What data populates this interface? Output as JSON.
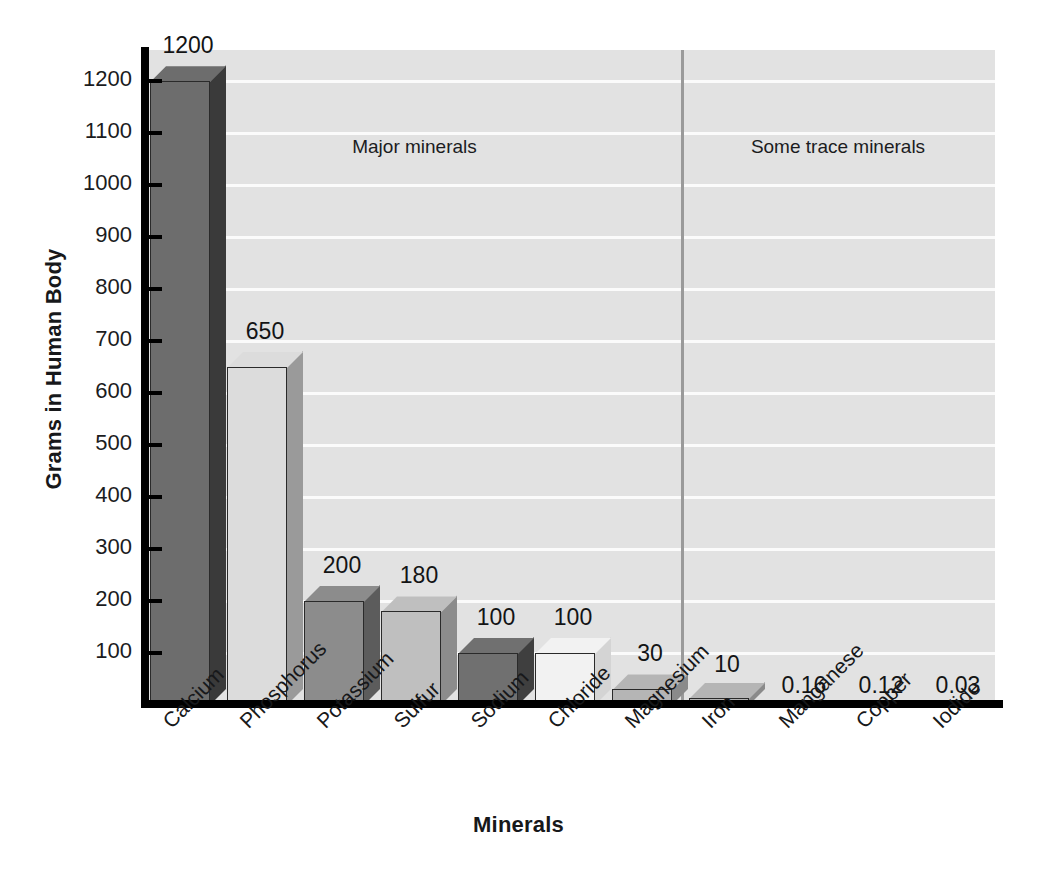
{
  "chart_data": {
    "type": "bar",
    "title": "",
    "xlabel": "Minerals",
    "ylabel": "Grams in Human Body",
    "categories": [
      "Calcium",
      "Phosphorus",
      "Potassium",
      "Sulfur",
      "Sodium",
      "Chloride",
      "Magnesium",
      "Iron",
      "Manganese",
      "Copper",
      "Iodide"
    ],
    "values": [
      1200,
      650,
      200,
      180,
      100,
      100,
      30,
      10,
      0.16,
      0.12,
      0.03
    ],
    "value_labels": [
      "1200",
      "650",
      "200",
      "180",
      "100",
      "100",
      "30",
      "10",
      "0.16",
      "0.12",
      "0.03"
    ],
    "ylim": [
      0,
      1260
    ],
    "ytick_values": [
      100,
      200,
      300,
      400,
      500,
      600,
      700,
      800,
      900,
      1000,
      1100,
      1200
    ],
    "ytick_labels": [
      "100",
      "200",
      "300",
      "400",
      "500",
      "600",
      "700",
      "800",
      "900",
      "1000",
      "1100",
      "1200"
    ],
    "grid": true,
    "gridlines_horizontal": true,
    "legend": "none",
    "annotations": [
      {
        "text": "Major minerals",
        "region": "left"
      },
      {
        "text": "Some trace minerals",
        "region": "right"
      }
    ],
    "divider_after_category": "Magnesium",
    "bar_colors": [
      "#6d6d6d",
      "#dcdcdc",
      "#8c8c8c",
      "#bfbfbf",
      "#707070",
      "#f2f2f2",
      "#b5b5b5",
      "#b5b5b5",
      "#b5b5b5",
      "#b5b5b5",
      "#b5b5b5"
    ],
    "bar_side_colors": [
      "#3a3a3a",
      "#9a9a9a",
      "#5c5c5c",
      "#8c8c8c",
      "#3f3f3f",
      "#d4d4d4",
      "#8a8a8a",
      "#8a8a8a",
      "#8a8a8a",
      "#8a8a8a",
      "#8a8a8a"
    ]
  },
  "axis": {
    "y_title": "Grams in Human Body",
    "x_title": "Minerals"
  },
  "sections": {
    "major": "Major minerals",
    "trace": "Some trace minerals"
  },
  "colors": {
    "plot_background": "#e2e2e2",
    "gridline": "#fbfbfb",
    "axis": "#000000",
    "divider": "#9a9a9a",
    "text": "#17181a"
  }
}
